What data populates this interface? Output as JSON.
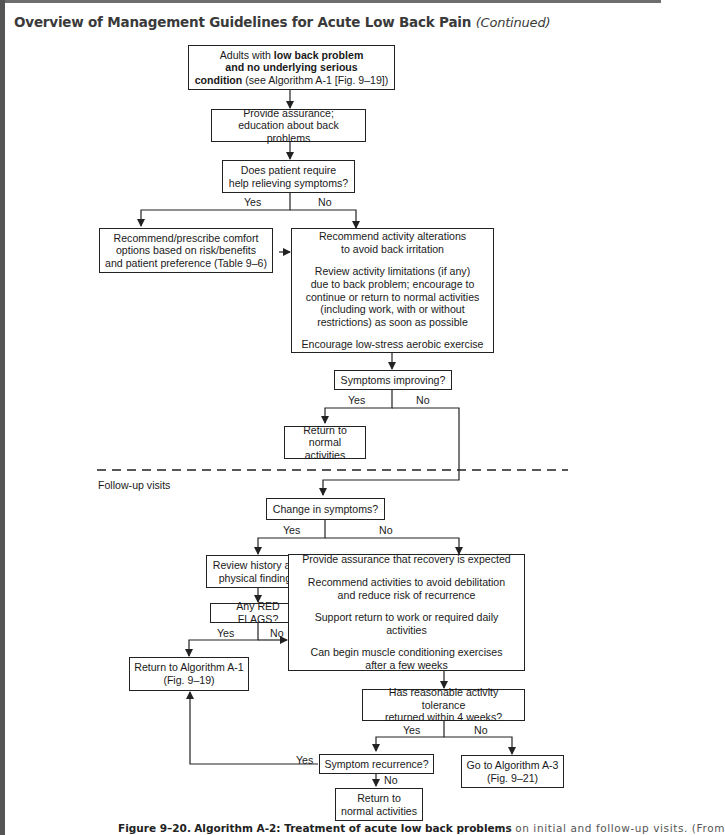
{
  "header": {
    "title": "Overview of Management Guidelines for Acute Low Back Pain",
    "continued": "(Continued)"
  },
  "flowchart": {
    "start": {
      "line1_pre": "Adults with ",
      "line1_bold": "low back problem",
      "line2_bold": "and no underlying serious",
      "line3_bold": "condition",
      "line3_rest": " (see Algorithm A-1 [Fig. 9–19])"
    },
    "assurance": [
      "Provide assurance;",
      "education about back problems"
    ],
    "require_help": [
      "Does patient require",
      "help relieving symptoms?"
    ],
    "comfort": [
      "Recommend/prescribe comfort",
      "options based on risk/benefits",
      "and patient preference (Table 9–6)"
    ],
    "activity": {
      "p1": [
        "Recommend activity alterations",
        "to avoid back irritation"
      ],
      "p2": [
        "Review activity limitations (if any)",
        "due to back problem; encourage to",
        "continue or return to normal activities",
        "(including work, with or without",
        "restrictions) as soon as possible"
      ],
      "p3": [
        "Encourage low-stress aerobic exercise"
      ]
    },
    "improving": "Symptoms improving?",
    "return_normal_1": [
      "Return to",
      "normal activities"
    ],
    "follow_up_label": "Follow-up visits",
    "change": "Change in symptoms?",
    "review_history": [
      "Review history and",
      "physical findings"
    ],
    "red_flags": "Any RED FLAGS?",
    "return_a1": [
      "Return to Algorithm A-1",
      "(Fig. 9–19)"
    ],
    "recovery": {
      "p1": [
        "Provide assurance that recovery is expected"
      ],
      "p2": [
        "Recommend activities to avoid debilitation",
        "and reduce risk of recurrence"
      ],
      "p3": [
        "Support return to work or required daily activities"
      ],
      "p4": [
        "Can begin muscle conditioning exercises",
        "after a few weeks"
      ]
    },
    "tolerance": [
      "Has reasonable activity tolerance",
      "returned within 4 weeks?"
    ],
    "recurrence": "Symptom recurrence?",
    "go_a3": [
      "Go to Algorithm A-3",
      "(Fig. 9–21)"
    ],
    "return_normal_2": [
      "Return to",
      "normal activities"
    ],
    "labels": {
      "yes": "Yes",
      "no": "No"
    }
  },
  "caption": {
    "figure": "Figure 9–20.",
    "bold": "Algorithm A-2: Treatment of acute low back problems",
    "rest": "on initial and follow-up visits. (From"
  },
  "colors": {
    "line": "#222222",
    "title": "#3a3a3a",
    "border": "#555555"
  }
}
